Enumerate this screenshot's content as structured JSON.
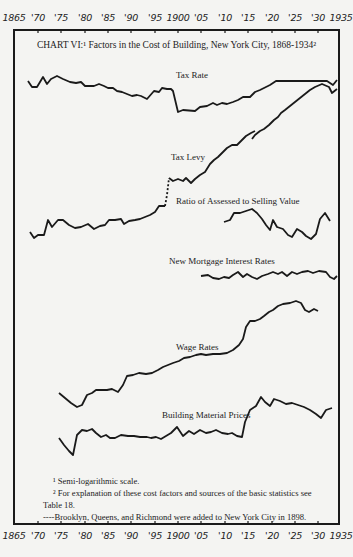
{
  "title": "CHART VI:¹ Factors in the Cost of Building, New York City, 1868-1934²",
  "axis": {
    "ticks": [
      {
        "label": "1865",
        "x": 14
      },
      {
        "label": "'70",
        "x": 38
      },
      {
        "label": "'75",
        "x": 61
      },
      {
        "label": "'80",
        "x": 85
      },
      {
        "label": "'85",
        "x": 108
      },
      {
        "label": "'90",
        "x": 131
      },
      {
        "label": "'95",
        "x": 155
      },
      {
        "label": "1900",
        "x": 178
      },
      {
        "label": "'05",
        "x": 201
      },
      {
        "label": "'10",
        "x": 225
      },
      {
        "label": "'15",
        "x": 248
      },
      {
        "label": "'20",
        "x": 272
      },
      {
        "label": "'25",
        "x": 295
      },
      {
        "label": "'30",
        "x": 318
      },
      {
        "label": "1935",
        "x": 341
      }
    ]
  },
  "labels": {
    "tax_rate": "Tax Rate",
    "tax_levy": "Tax Levy",
    "ratio": "Ratio of Assessed to Selling Value",
    "mortgage": "New Mortgage Interest Rates",
    "wage": "Wage Rates",
    "material": "Building Material Prices"
  },
  "footnotes": {
    "f1": "¹ Semi-logarithmic scale.",
    "f2a": "² For explanation of these cost factors and sources of the basic statistics see",
    "f2b": "Table 18.",
    "f3": "----Brooklyn, Queens, and Richmond were added to New York City in 1898."
  },
  "chart_data": {
    "type": "line",
    "xlabel": "Year",
    "ylabel": "Relative index (semi-logarithmic scale, no numeric y-axis shown)",
    "xlim": [
      1865,
      1935
    ],
    "x_ticks": [
      "1865",
      "'70",
      "'75",
      "'80",
      "'85",
      "'90",
      "'95",
      "1900",
      "'05",
      "'10",
      "'15",
      "'20",
      "'25",
      "'30",
      "1935"
    ],
    "grid": false,
    "legend": "inline labels",
    "note": "Values are approximate relative heights (higher = larger), read in screen pixels from each curve's baseline; no y-axis scale is printed.",
    "series": [
      {
        "name": "Tax Rate",
        "points": [
          [
            1868,
            82
          ],
          [
            1869,
            78
          ],
          [
            1870,
            78
          ],
          [
            1872,
            84
          ],
          [
            1873,
            80
          ],
          [
            1874,
            84
          ],
          [
            1875,
            85
          ],
          [
            1877,
            83
          ],
          [
            1879,
            81
          ],
          [
            1881,
            81
          ],
          [
            1882,
            77
          ],
          [
            1884,
            77
          ],
          [
            1885,
            79
          ],
          [
            1887,
            76
          ],
          [
            1888,
            74
          ],
          [
            1890,
            70
          ],
          [
            1892,
            69
          ],
          [
            1894,
            68
          ],
          [
            1896,
            72
          ],
          [
            1898,
            71
          ],
          [
            1899,
            76
          ],
          [
            1900,
            74
          ],
          [
            1901,
            75
          ],
          [
            1902,
            74
          ],
          [
            1903,
            57
          ],
          [
            1904,
            59
          ],
          [
            1907,
            59
          ],
          [
            1908,
            62
          ],
          [
            1910,
            64
          ],
          [
            1911,
            63
          ],
          [
            1912,
            65
          ],
          [
            1914,
            64
          ],
          [
            1916,
            67
          ],
          [
            1918,
            69
          ],
          [
            1919,
            72
          ],
          [
            1921,
            75
          ],
          [
            1923,
            79
          ],
          [
            1926,
            78
          ],
          [
            1929,
            78
          ],
          [
            1931,
            78
          ],
          [
            1932,
            75
          ],
          [
            1933,
            79
          ]
        ]
      },
      {
        "name": "Tax Levy",
        "points": [
          [
            1868,
            15
          ],
          [
            1869,
            11
          ],
          [
            1870,
            13
          ],
          [
            1871,
            13
          ],
          [
            1872,
            22
          ],
          [
            1873,
            18
          ],
          [
            1874,
            21
          ],
          [
            1875,
            21
          ],
          [
            1877,
            18
          ],
          [
            1878,
            16
          ],
          [
            1880,
            16
          ],
          [
            1882,
            18
          ],
          [
            1883,
            15
          ],
          [
            1885,
            17
          ],
          [
            1886,
            19
          ],
          [
            1888,
            19
          ],
          [
            1889,
            20
          ],
          [
            1890,
            17
          ],
          [
            1891,
            19
          ],
          [
            1893,
            19
          ],
          [
            1895,
            21
          ],
          [
            1896,
            23
          ],
          [
            1897,
            27
          ],
          [
            1898,
            27
          ],
          [
            1898.5,
            47
          ],
          [
            1899,
            47
          ],
          [
            1900,
            46
          ],
          [
            1901,
            47
          ],
          [
            1902,
            44
          ],
          [
            1903,
            47
          ],
          [
            1904,
            48
          ],
          [
            1905,
            53
          ],
          [
            1906,
            60
          ],
          [
            1908,
            64
          ],
          [
            1910,
            69
          ],
          [
            1911,
            69
          ],
          [
            1913,
            72
          ],
          [
            1914,
            74
          ],
          [
            1915,
            82
          ],
          [
            1916,
            84
          ],
          [
            1918,
            87
          ],
          [
            1920,
            95
          ],
          [
            1922,
            101
          ],
          [
            1924,
            106
          ],
          [
            1926,
            109
          ],
          [
            1929,
            112
          ],
          [
            1930,
            109
          ],
          [
            1931,
            104
          ],
          [
            1932,
            107
          ]
        ]
      },
      {
        "name": "Ratio of Assessed to Selling Value",
        "points": [
          [
            1909,
            20
          ],
          [
            1911,
            22
          ],
          [
            1912,
            27
          ],
          [
            1914,
            28
          ],
          [
            1915,
            27
          ],
          [
            1916,
            29
          ],
          [
            1917,
            28
          ],
          [
            1919,
            22
          ],
          [
            1920,
            17
          ],
          [
            1921,
            13
          ],
          [
            1922,
            22
          ],
          [
            1923,
            18
          ],
          [
            1924,
            18
          ],
          [
            1925,
            16
          ],
          [
            1926,
            11
          ],
          [
            1927,
            17
          ],
          [
            1928,
            19
          ],
          [
            1929,
            15
          ],
          [
            1930,
            12
          ],
          [
            1931,
            14
          ],
          [
            1932,
            30
          ],
          [
            1933,
            35
          ],
          [
            1934,
            30
          ]
        ]
      },
      {
        "name": "New Mortgage Interest Rates",
        "points": [
          [
            1906,
            12
          ],
          [
            1907,
            12
          ],
          [
            1908,
            10
          ],
          [
            1909,
            9
          ],
          [
            1911,
            10
          ],
          [
            1912,
            12
          ],
          [
            1913,
            14
          ],
          [
            1914,
            11
          ],
          [
            1915,
            13
          ],
          [
            1916,
            10
          ],
          [
            1917,
            12
          ],
          [
            1918,
            13
          ],
          [
            1919,
            15
          ],
          [
            1920,
            15
          ],
          [
            1921,
            13
          ],
          [
            1922,
            15
          ],
          [
            1923,
            14
          ],
          [
            1924,
            15
          ],
          [
            1925,
            14
          ],
          [
            1926,
            15
          ],
          [
            1927,
            14
          ],
          [
            1928,
            15
          ],
          [
            1929,
            14
          ],
          [
            1931,
            14
          ],
          [
            1932,
            8
          ],
          [
            1933,
            10
          ]
        ]
      },
      {
        "name": "Wage Rates",
        "points": [
          [
            1872,
            40
          ],
          [
            1874,
            35
          ],
          [
            1876,
            30
          ],
          [
            1877,
            31
          ],
          [
            1879,
            37
          ],
          [
            1880,
            40
          ],
          [
            1881,
            38
          ],
          [
            1882,
            41
          ],
          [
            1884,
            41
          ],
          [
            1886,
            40
          ],
          [
            1887,
            39
          ],
          [
            1888,
            44
          ],
          [
            1890,
            45
          ],
          [
            1893,
            44
          ],
          [
            1895,
            48
          ],
          [
            1897,
            51
          ],
          [
            1899,
            53
          ],
          [
            1901,
            55
          ],
          [
            1903,
            56
          ],
          [
            1906,
            56
          ],
          [
            1908,
            58
          ],
          [
            1909,
            62
          ],
          [
            1910,
            69
          ],
          [
            1911,
            75
          ],
          [
            1912,
            76
          ],
          [
            1913,
            80
          ],
          [
            1914,
            82
          ],
          [
            1916,
            88
          ],
          [
            1918,
            91
          ],
          [
            1920,
            93
          ],
          [
            1921,
            90
          ],
          [
            1922,
            86
          ],
          [
            1923,
            87
          ]
        ]
      },
      {
        "name": "Building Material Prices",
        "points": [
          [
            1873,
            30
          ],
          [
            1875,
            23
          ],
          [
            1876,
            20
          ],
          [
            1877,
            33
          ],
          [
            1878,
            35
          ],
          [
            1880,
            37
          ],
          [
            1881,
            33
          ],
          [
            1882,
            32
          ],
          [
            1883,
            32
          ],
          [
            1884,
            31
          ],
          [
            1885,
            33
          ],
          [
            1886,
            32
          ],
          [
            1888,
            31
          ],
          [
            1890,
            31
          ],
          [
            1891,
            31
          ],
          [
            1892,
            29
          ],
          [
            1894,
            32
          ],
          [
            1895,
            36
          ],
          [
            1896,
            32
          ],
          [
            1898,
            35
          ],
          [
            1899,
            33
          ],
          [
            1900,
            34
          ],
          [
            1901,
            36
          ],
          [
            1903,
            34
          ],
          [
            1904,
            33
          ],
          [
            1905,
            30
          ],
          [
            1906,
            31
          ],
          [
            1907,
            28
          ],
          [
            1908,
            28
          ],
          [
            1909,
            33
          ],
          [
            1910,
            44
          ],
          [
            1911,
            48
          ],
          [
            1912,
            53
          ],
          [
            1913,
            49
          ],
          [
            1914,
            53
          ],
          [
            1915,
            50
          ],
          [
            1916,
            50
          ],
          [
            1918,
            47
          ],
          [
            1920,
            44
          ],
          [
            1921,
            40
          ],
          [
            1922,
            43
          ],
          [
            1923,
            44
          ]
        ]
      }
    ],
    "annotations": [
      "Dashed segment in Tax Levy at 1898: Brooklyn, Queens, and Richmond were added to New York City in 1898.",
      "¹ Semi-logarithmic scale.",
      "² For explanation of these cost factors and sources of the basic statistics see Table 18."
    ]
  }
}
